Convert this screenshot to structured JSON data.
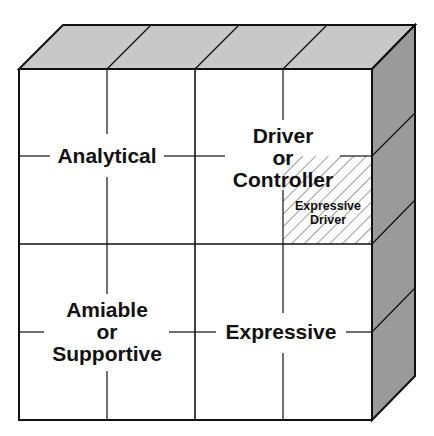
{
  "diagram": {
    "type": "social-style-cube",
    "colors": {
      "front_face": "#ffffff",
      "top_face": "#c8c8c8",
      "side_face": "#9a9a9a",
      "lines": "#111111"
    },
    "quadrants": [
      {
        "id": "analytical",
        "lines": [
          "Analytical"
        ]
      },
      {
        "id": "driver",
        "lines": [
          "Driver",
          "or",
          "Controller"
        ]
      },
      {
        "id": "amiable",
        "lines": [
          "Amiable",
          "or",
          "Supportive"
        ]
      },
      {
        "id": "expressive",
        "lines": [
          "Expressive"
        ]
      }
    ],
    "subcell": {
      "id": "expressive-driver",
      "lines": [
        "Expressive",
        "Driver"
      ],
      "pattern": "hatched"
    }
  }
}
